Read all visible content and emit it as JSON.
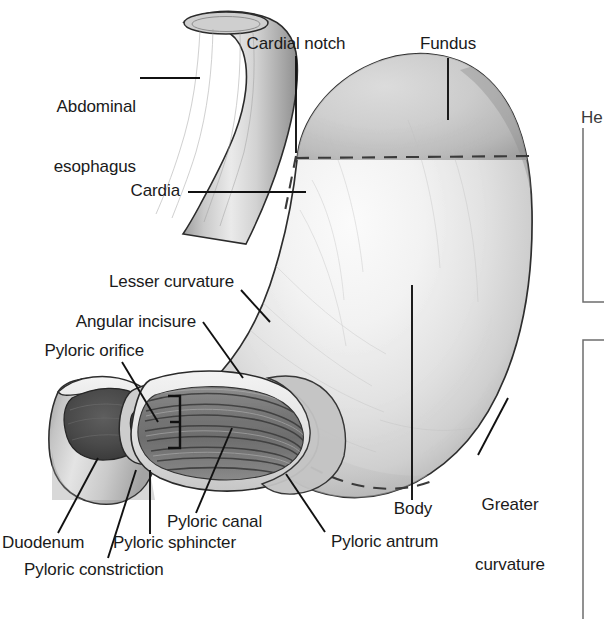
{
  "figure": {
    "organ": "stomach",
    "style": "grayscale medical illustration",
    "background_color": "#ffffff",
    "line_color": "#111111",
    "dashed_boundary_color": "#3a3a3a"
  },
  "labels": {
    "abdominal_esophagus": "Abdominal\nesophagus",
    "abdominal_esophagus_l1": "Abdominal",
    "abdominal_esophagus_l2": "esophagus",
    "cardial_notch": "Cardial notch",
    "fundus": "Fundus",
    "cardia": "Cardia",
    "lesser_curvature": "Lesser curvature",
    "angular_incisure": "Angular incisure",
    "pyloric_orifice": "Pyloric orifice",
    "duodenum": "Duodenum",
    "pyloric_sphincter": "Pyloric sphincter",
    "pyloric_constriction": "Pyloric constriction",
    "pyloric_canal": "Pyloric canal",
    "pyloric_antrum": "Pyloric antrum",
    "body": "Body",
    "greater_curvature_l1": "Greater",
    "greater_curvature_l2": "curvature",
    "clipped_right_panel": "He"
  },
  "label_list": [
    {
      "name": "abdominal-esophagus",
      "text": "Abdominal esophagus"
    },
    {
      "name": "cardial-notch",
      "text": "Cardial notch"
    },
    {
      "name": "fundus",
      "text": "Fundus"
    },
    {
      "name": "cardia",
      "text": "Cardia"
    },
    {
      "name": "lesser-curvature",
      "text": "Lesser curvature"
    },
    {
      "name": "angular-incisure",
      "text": "Angular incisure"
    },
    {
      "name": "pyloric-orifice",
      "text": "Pyloric orifice"
    },
    {
      "name": "duodenum",
      "text": "Duodenum"
    },
    {
      "name": "pyloric-sphincter",
      "text": "Pyloric sphincter"
    },
    {
      "name": "pyloric-constriction",
      "text": "Pyloric constriction"
    },
    {
      "name": "pyloric-canal",
      "text": "Pyloric canal"
    },
    {
      "name": "pyloric-antrum",
      "text": "Pyloric antrum"
    },
    {
      "name": "body",
      "text": "Body"
    },
    {
      "name": "greater-curvature",
      "text": "Greater curvature"
    }
  ]
}
